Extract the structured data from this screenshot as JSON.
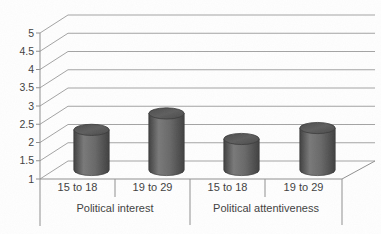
{
  "chart_data": {
    "type": "bar",
    "subtype": "3d-cylinder",
    "title": "",
    "legend": "none",
    "grid": true,
    "groups": [
      {
        "label": "Political interest",
        "categories": [
          "15 to 18",
          "19 to 29"
        ],
        "values": [
          2.1,
          2.55
        ]
      },
      {
        "label": "Political attentiveness",
        "categories": [
          "15 to 18",
          "19 to 29"
        ],
        "values": [
          1.85,
          2.15
        ]
      }
    ],
    "categories": [
      "15 to 18",
      "19 to 29",
      "15 to 18",
      "19 to 29"
    ],
    "values": [
      2.1,
      2.55,
      1.85,
      2.15
    ],
    "ylim": [
      1,
      5
    ],
    "ytick_step": 0.5,
    "yticks": [
      5,
      4.5,
      4,
      3.5,
      3,
      2.5,
      2,
      1.5,
      1
    ],
    "colors": {
      "grid_line": "#a3a3a3",
      "axis_line": "#8f8f8f",
      "text": "#3d3d3d",
      "bar_dark": "#3e3e3e",
      "bar_mid": "#787878",
      "bar_body": "#676767",
      "bar_cap": "#5d5d5d",
      "bar_edge": "#383838",
      "background": "#ffffff"
    }
  }
}
